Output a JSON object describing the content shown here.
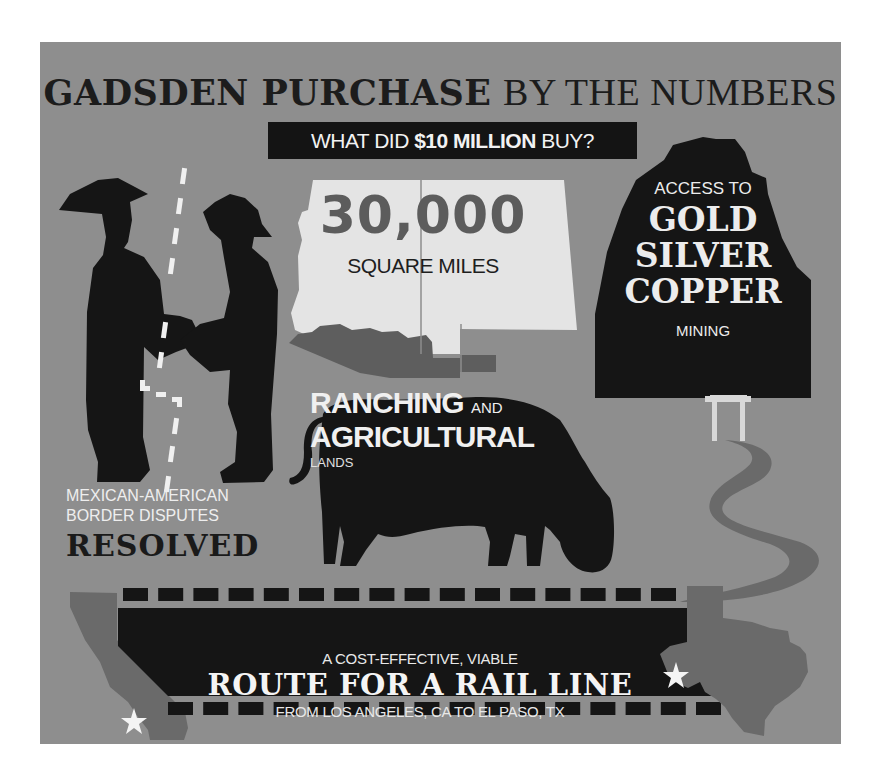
{
  "title": {
    "bold": "GADSDEN PURCHASE",
    "light": "BY THE NUMBERS"
  },
  "banner": {
    "prefix": "WHAT DID ",
    "highlight": "$10 MILLION",
    "suffix": " BUY?"
  },
  "area": {
    "value": "30,000",
    "unit": "SQUARE MILES"
  },
  "mining": {
    "intro": "ACCESS TO",
    "metals": [
      "GOLD",
      "SILVER",
      "COPPER"
    ],
    "outro": "MINING"
  },
  "ranching": {
    "line1_big": "RANCHING",
    "line1_small": "AND",
    "line2": "AGRICULTURAL",
    "line3": "LANDS"
  },
  "border": {
    "line1": "MEXICAN-AMERICAN",
    "line2": "BORDER DISPUTES",
    "emphasis": "RESOLVED"
  },
  "rail": {
    "intro": "A COST-EFFECTIVE, VIABLE",
    "headline": "ROUTE FOR A RAIL LINE",
    "detail": "FROM LOS ANGELES, CA TO EL PASO, TX"
  },
  "colors": {
    "background": "#8e8e8e",
    "dark": "#151515",
    "light": "#ececec",
    "mid_gray": "#5e5e5e",
    "state_gray": "#6a6a6a"
  }
}
